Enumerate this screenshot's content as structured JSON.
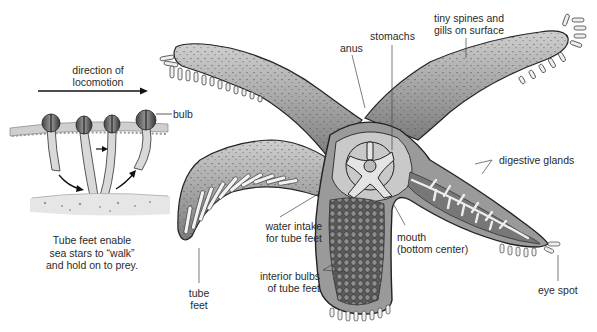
{
  "inset": {
    "direction_label_line1": "direction of",
    "direction_label_line2": "locomotion",
    "bulb_label": "bulb",
    "caption_line1": "Tube feet enable",
    "caption_line2": "sea stars to “walk”",
    "caption_line3": "and hold on to prey."
  },
  "labels": {
    "anus": "anus",
    "stomachs": "stomachs",
    "spines_line1": "tiny spines and",
    "spines_line2": "gills on surface",
    "digestive_glands": "digestive glands",
    "water_intake_line1": "water intake",
    "water_intake_line2": "for tube feet",
    "mouth_line1": "mouth",
    "mouth_line2": "(bottom center)",
    "interior_bulbs_line1": "interior bulbs",
    "interior_bulbs_line2": "of tube feet",
    "tube_feet_line1": "tube",
    "tube_feet_line2": "feet",
    "eye_spot": "eye spot"
  }
}
